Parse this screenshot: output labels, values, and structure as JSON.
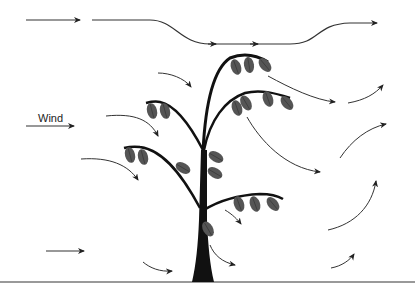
{
  "diagram": {
    "type": "illustration",
    "label": "Wind",
    "colors": {
      "line": "#333333",
      "tree": "#111111",
      "leaf": "#555555",
      "ground": "#777777",
      "background": "#ffffff"
    },
    "elements": [
      {
        "id": "wind-arrow-top-left",
        "kind": "arrow",
        "direction": "right"
      },
      {
        "id": "wind-stream-top",
        "kind": "streamline",
        "direction": "right",
        "shape": "dips over canopy then rises"
      },
      {
        "id": "wind-arrow-labeled",
        "kind": "arrow",
        "direction": "right",
        "label": "Wind"
      },
      {
        "id": "wind-arrow-bottom-left",
        "kind": "arrow",
        "direction": "right"
      },
      {
        "id": "deflect-arrows-upwind",
        "kind": "curved-arrows",
        "count": 3,
        "direction": "down-right"
      },
      {
        "id": "deflect-arrows-downwind",
        "kind": "curved-arrows",
        "count": 4,
        "direction": "down-right"
      },
      {
        "id": "rising-arrows-lee",
        "kind": "curved-arrows",
        "count": 4,
        "direction": "up-right"
      },
      {
        "id": "tree",
        "kind": "tree",
        "branches": 5
      },
      {
        "id": "ground",
        "kind": "line"
      }
    ]
  }
}
